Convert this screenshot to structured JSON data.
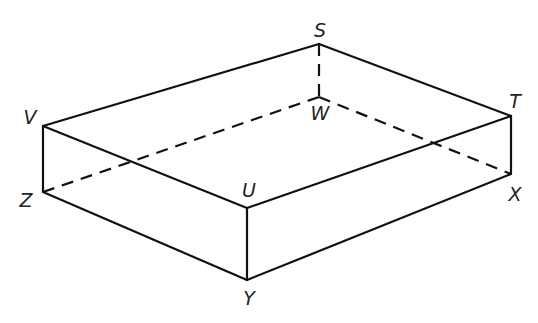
{
  "diagram": {
    "type": "rectangular prism (cuboid) in oblique projection",
    "vertices": {
      "S": {
        "x": 319,
        "y": 44,
        "label_x": 320,
        "label_y": 30
      },
      "T": {
        "x": 511,
        "y": 116,
        "label_x": 515,
        "label_y": 101
      },
      "U": {
        "x": 247,
        "y": 208,
        "label_x": 249,
        "label_y": 190
      },
      "V": {
        "x": 43,
        "y": 126,
        "label_x": 30,
        "label_y": 117
      },
      "W": {
        "x": 319,
        "y": 97,
        "label_x": 320,
        "label_y": 113
      },
      "X": {
        "x": 511,
        "y": 174,
        "label_x": 515,
        "label_y": 194
      },
      "Y": {
        "x": 247,
        "y": 280,
        "label_x": 249,
        "label_y": 298
      },
      "Z": {
        "x": 43,
        "y": 192,
        "label_x": 26,
        "label_y": 200
      }
    },
    "labels": [
      "S",
      "T",
      "U",
      "V",
      "W",
      "X",
      "Y",
      "Z"
    ],
    "solid_edges": [
      [
        "S",
        "T"
      ],
      [
        "S",
        "V"
      ],
      [
        "V",
        "U"
      ],
      [
        "U",
        "T"
      ],
      [
        "V",
        "Z"
      ],
      [
        "U",
        "Y"
      ],
      [
        "T",
        "X"
      ],
      [
        "Z",
        "Y"
      ],
      [
        "Y",
        "X"
      ]
    ],
    "hidden_edges": [
      [
        "S",
        "W"
      ],
      [
        "W",
        "Z"
      ],
      [
        "W",
        "X"
      ]
    ],
    "colors": {
      "line": "#111111",
      "label": "#222222",
      "background": "#ffffff"
    }
  }
}
